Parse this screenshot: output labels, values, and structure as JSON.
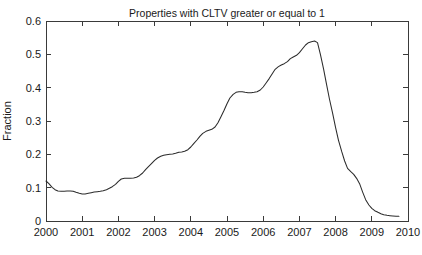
{
  "chart_data": {
    "type": "line",
    "title": "Properties with CLTV greater or equal to 1",
    "xlabel": "",
    "ylabel": "Fraction",
    "xlim": [
      2000,
      2010
    ],
    "ylim": [
      0,
      0.6
    ],
    "grid": false,
    "legend": null,
    "legend_position": "none",
    "xticks": [
      2000,
      2001,
      2002,
      2003,
      2004,
      2005,
      2006,
      2007,
      2008,
      2009,
      2010
    ],
    "xtick_labels": [
      "2000",
      "2001",
      "2002",
      "2003",
      "2004",
      "2005",
      "2006",
      "2007",
      "2008",
      "2009",
      "2010"
    ],
    "yticks": [
      0,
      0.1,
      0.2,
      0.3,
      0.4,
      0.5,
      0.6
    ],
    "ytick_labels": [
      "0",
      "0.1",
      "0.2",
      "0.3",
      "0.4",
      "0.5",
      "0.6"
    ],
    "line_color": "#2b2b2b",
    "series": [
      {
        "name": "Fraction of properties with CLTV >= 1",
        "x": [
          2000.0,
          2000.08,
          2000.17,
          2000.25,
          2000.33,
          2000.42,
          2000.5,
          2000.58,
          2000.67,
          2000.75,
          2000.83,
          2000.92,
          2001.0,
          2001.08,
          2001.17,
          2001.25,
          2001.33,
          2001.42,
          2001.5,
          2001.58,
          2001.67,
          2001.75,
          2001.83,
          2001.92,
          2002.0,
          2002.08,
          2002.17,
          2002.25,
          2002.33,
          2002.42,
          2002.5,
          2002.58,
          2002.67,
          2002.75,
          2002.83,
          2002.92,
          2003.0,
          2003.08,
          2003.17,
          2003.25,
          2003.33,
          2003.42,
          2003.5,
          2003.58,
          2003.67,
          2003.75,
          2003.83,
          2003.92,
          2004.0,
          2004.08,
          2004.17,
          2004.25,
          2004.33,
          2004.42,
          2004.5,
          2004.58,
          2004.67,
          2004.75,
          2004.83,
          2004.92,
          2005.0,
          2005.08,
          2005.17,
          2005.25,
          2005.33,
          2005.42,
          2005.5,
          2005.58,
          2005.67,
          2005.75,
          2005.83,
          2005.92,
          2006.0,
          2006.08,
          2006.17,
          2006.25,
          2006.33,
          2006.42,
          2006.5,
          2006.58,
          2006.67,
          2006.75,
          2006.83,
          2006.92,
          2007.0,
          2007.08,
          2007.17,
          2007.25,
          2007.33,
          2007.42,
          2007.5,
          2007.58,
          2007.67,
          2007.75,
          2007.83,
          2007.92,
          2008.0,
          2008.08,
          2008.17,
          2008.25,
          2008.33,
          2008.42,
          2008.5,
          2008.58,
          2008.67,
          2008.75,
          2008.83,
          2008.92,
          2009.0,
          2009.08,
          2009.17,
          2009.25,
          2009.33,
          2009.42,
          2009.5,
          2009.58,
          2009.67,
          2009.75
        ],
        "y": [
          0.12,
          0.112,
          0.101,
          0.094,
          0.09,
          0.089,
          0.089,
          0.09,
          0.09,
          0.089,
          0.086,
          0.083,
          0.081,
          0.081,
          0.083,
          0.085,
          0.087,
          0.088,
          0.089,
          0.091,
          0.094,
          0.098,
          0.103,
          0.11,
          0.119,
          0.126,
          0.128,
          0.128,
          0.128,
          0.129,
          0.131,
          0.136,
          0.144,
          0.154,
          0.163,
          0.173,
          0.182,
          0.189,
          0.194,
          0.197,
          0.199,
          0.2,
          0.201,
          0.203,
          0.206,
          0.207,
          0.209,
          0.214,
          0.222,
          0.232,
          0.243,
          0.254,
          0.263,
          0.269,
          0.272,
          0.275,
          0.282,
          0.295,
          0.312,
          0.332,
          0.352,
          0.369,
          0.38,
          0.386,
          0.388,
          0.388,
          0.386,
          0.385,
          0.385,
          0.386,
          0.388,
          0.393,
          0.402,
          0.414,
          0.428,
          0.442,
          0.455,
          0.463,
          0.468,
          0.472,
          0.478,
          0.487,
          0.492,
          0.497,
          0.505,
          0.516,
          0.528,
          0.535,
          0.538,
          0.54,
          0.535,
          0.5,
          0.455,
          0.41,
          0.366,
          0.322,
          0.28,
          0.242,
          0.208,
          0.18,
          0.158,
          0.148,
          0.14,
          0.128,
          0.11,
          0.086,
          0.064,
          0.048,
          0.038,
          0.031,
          0.026,
          0.022,
          0.019,
          0.017,
          0.016,
          0.015,
          0.014,
          0.014
        ]
      }
    ],
    "annotations": [
      {
        "label": "peak",
        "x": 2006.42,
        "y": 0.54
      },
      {
        "label": "initial value",
        "x": 2000.0,
        "y": 0.12
      },
      {
        "label": "trough",
        "x": 2001.0,
        "y": 0.081
      },
      {
        "label": "final value",
        "x": 2009.75,
        "y": 0.014
      }
    ]
  }
}
